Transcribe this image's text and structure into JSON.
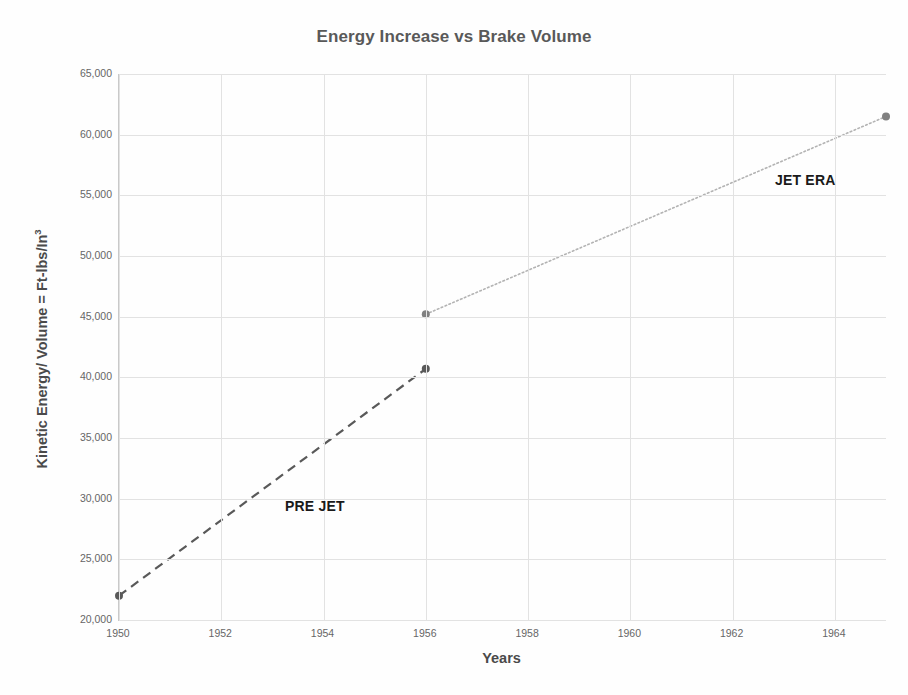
{
  "chart_data": {
    "type": "line",
    "title": "Energy Increase vs Brake Volume",
    "xlabel": "Years",
    "ylabel": "Kinetic Energy/ Volume = Ft-lbs/In³",
    "ylabel_base": "Kinetic Energy/ Volume = Ft-lbs/In",
    "ylabel_sup": "3",
    "xlim": [
      1950,
      1965
    ],
    "ylim": [
      20000,
      65000
    ],
    "grid": true,
    "legend": "none",
    "x_ticks": [
      1950,
      1952,
      1954,
      1956,
      1958,
      1960,
      1962,
      1964
    ],
    "x_tick_labels": [
      "1950",
      "1952",
      "1954",
      "1956",
      "1958",
      "1960",
      "1962",
      "1964"
    ],
    "y_ticks": [
      20000,
      25000,
      30000,
      35000,
      40000,
      45000,
      50000,
      55000,
      60000,
      65000
    ],
    "y_tick_labels": [
      "20,000",
      "25,000",
      "30,000",
      "35,000",
      "40,000",
      "45,000",
      "50,000",
      "55,000",
      "60,000",
      "65,000"
    ],
    "series": [
      {
        "name": "PRE JET",
        "style": "dashed",
        "color": "#595959",
        "marker_color": "#595959",
        "x": [
          1950,
          1956
        ],
        "values": [
          22000,
          40700
        ]
      },
      {
        "name": "JET ERA",
        "style": "dotted",
        "color": "#b3b3b3",
        "marker_color": "#808080",
        "x": [
          1956,
          1965
        ],
        "values": [
          45200,
          61500
        ]
      }
    ],
    "annotations": [
      {
        "text": "PRE JET",
        "x": 1952.6,
        "y": 30200
      },
      {
        "text": "JET ERA",
        "x": 1962.9,
        "y": 56600
      }
    ]
  },
  "colors": {
    "title": "#595959",
    "axis_label": "#4a4a4a",
    "tick": "#666666",
    "grid": "#e2e2e2",
    "axis_line": "#c9c9c9",
    "pre_jet": "#595959",
    "jet_era": "#b3b3b3",
    "annotation": "#1a1a1a",
    "background": "#fefefe"
  }
}
